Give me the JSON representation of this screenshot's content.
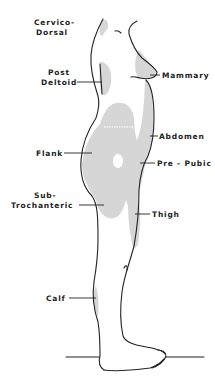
{
  "diagram": {
    "type": "anatomical-site-map",
    "colors": {
      "outline": "#222222",
      "shade": "#d6d6d6",
      "background": "#ffffff"
    },
    "labels": {
      "cervico_dorsal_1": "Cervico-",
      "cervico_dorsal_2": "Dorsal",
      "post_deltoid_1": "Post",
      "post_deltoid_2": "Deltoid",
      "mammary": "Mammary",
      "abdomen": "Abdomen",
      "flank": "Flank",
      "pre_pubic": "Pre - Pubic",
      "sub_trochanteric_1": "Sub-",
      "sub_trochanteric_2": "Trochanteric",
      "thigh": "Thigh",
      "calf": "Calf"
    }
  }
}
